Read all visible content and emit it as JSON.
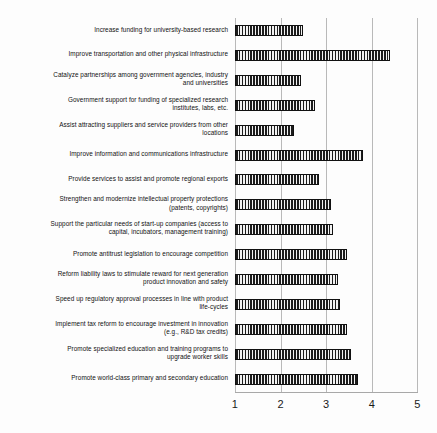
{
  "chart_data": {
    "type": "bar",
    "orientation": "horizontal",
    "title": "",
    "xlabel": "",
    "ylabel": "",
    "xlim": [
      1,
      5
    ],
    "xticks": [
      "1",
      "2",
      "3",
      "4",
      "5"
    ],
    "grid": true,
    "legend": "none",
    "categories": [
      "Increase funding for university-based research",
      "Improve transportation and other physical infrastructure",
      "Catalyze partnerships among government agencies, industry and universities",
      "Government support for funding of specialized research institutes, labs, etc.",
      "Assist attracting suppliers and service providers from other locations",
      "Improve information and communications infrastructure",
      "Provide services to assist and promote regional exports",
      "Strengthen and modernize intellectual property protections (patents, copyrights)",
      "Support the particular needs of start-up companies (access to capital, incubators, management training)",
      "Promote antitrust legislation to encourage competition",
      "Reform liability laws to stimulate reward for next generation product innovation and safety",
      "Speed up regulatory approval processes in line with product life-cycles",
      "Implement tax reform to encourage investment in innovation (e.g., R&D tax credits)",
      "Promote specialized education and training programs to upgrade worker skills",
      "Promote world-class primary and secondary education"
    ],
    "values": [
      2.5,
      4.4,
      2.45,
      2.75,
      2.3,
      3.8,
      2.85,
      3.1,
      3.15,
      3.45,
      3.25,
      3.3,
      3.45,
      3.55,
      3.7
    ]
  },
  "rows": [
    {
      "label_line1": "Increase funding for university-based research",
      "label_line2": "",
      "value": 2.5
    },
    {
      "label_line1": "Improve transportation and other physical infrastructure",
      "label_line2": "",
      "value": 4.4
    },
    {
      "label_line1": "Catalyze partnerships among government agencies, industry",
      "label_line2": "and universities",
      "value": 2.45
    },
    {
      "label_line1": "Government support for funding of specialized research",
      "label_line2": "institutes, labs, etc.",
      "value": 2.75
    },
    {
      "label_line1": "Assist attracting suppliers and service providers from other",
      "label_line2": "locations",
      "value": 2.3
    },
    {
      "label_line1": "Improve information and communications infrastructure",
      "label_line2": "",
      "value": 3.8
    },
    {
      "label_line1": "Provide services to assist and promote regional exports",
      "label_line2": "",
      "value": 2.85
    },
    {
      "label_line1": "Strengthen and modernize intellectual property protections",
      "label_line2": "(patents, copyrights)",
      "value": 3.1
    },
    {
      "label_line1": "Support the particular needs of start-up companies (access to",
      "label_line2": "capital, incubators, management training)",
      "value": 3.15
    },
    {
      "label_line1": "Promote antitrust legislation to encourage competition",
      "label_line2": "",
      "value": 3.45
    },
    {
      "label_line1": "Reform liability laws to stimulate reward for next generation",
      "label_line2": "product innovation and safety",
      "value": 3.25
    },
    {
      "label_line1": "Speed up regulatory approval processes in line with product",
      "label_line2": "life-cycles",
      "value": 3.3
    },
    {
      "label_line1": "Implement tax reform to encourage investment in innovation",
      "label_line2": "(e.g., R&D tax credits)",
      "value": 3.45
    },
    {
      "label_line1": "Promote specialized education and training programs to",
      "label_line2": "upgrade worker skills",
      "value": 3.55
    },
    {
      "label_line1": "Promote world-class primary and secondary education",
      "label_line2": "",
      "value": 3.7
    }
  ],
  "axis": {
    "ticks": [
      {
        "label": "1",
        "value": 1
      },
      {
        "label": "2",
        "value": 2
      },
      {
        "label": "3",
        "value": 3
      },
      {
        "label": "4",
        "value": 4
      },
      {
        "label": "5",
        "value": 5
      }
    ]
  },
  "colors": {
    "bar_fill": "#262626",
    "bar_stripe": "#f2f2f2",
    "gridline": "#b9b9b9",
    "text": "#111111",
    "background": "#fdfdfd"
  }
}
